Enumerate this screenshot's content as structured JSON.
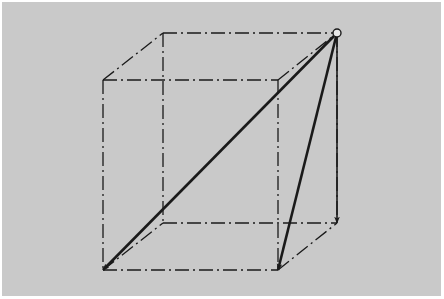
{
  "diagram": {
    "type": "cube-vector-diagram",
    "background_color": "#c9c9c9",
    "line_color": "#1a1a1a",
    "cube": {
      "back_face": {
        "top_left": [
          163,
          33
        ],
        "top_right": [
          337,
          33
        ],
        "bottom_left": [
          163,
          223
        ],
        "bottom_right": [
          337,
          223
        ]
      },
      "front_face": {
        "top_left": [
          103,
          80
        ],
        "top_right": [
          278,
          80
        ],
        "bottom_left": [
          103,
          270
        ],
        "bottom_right": [
          278,
          270
        ]
      },
      "edge_style": "dash-dot"
    },
    "origin": {
      "point": [
        337,
        33
      ],
      "marker": "open-circle"
    },
    "vectors": [
      {
        "name": "space-diagonal",
        "from": [
          337,
          33
        ],
        "to": [
          103,
          270
        ]
      },
      {
        "name": "face-diagonal",
        "from": [
          337,
          33
        ],
        "to": [
          278,
          270
        ]
      },
      {
        "name": "vertical-edge",
        "from": [
          337,
          33
        ],
        "to": [
          337,
          223
        ]
      }
    ]
  }
}
